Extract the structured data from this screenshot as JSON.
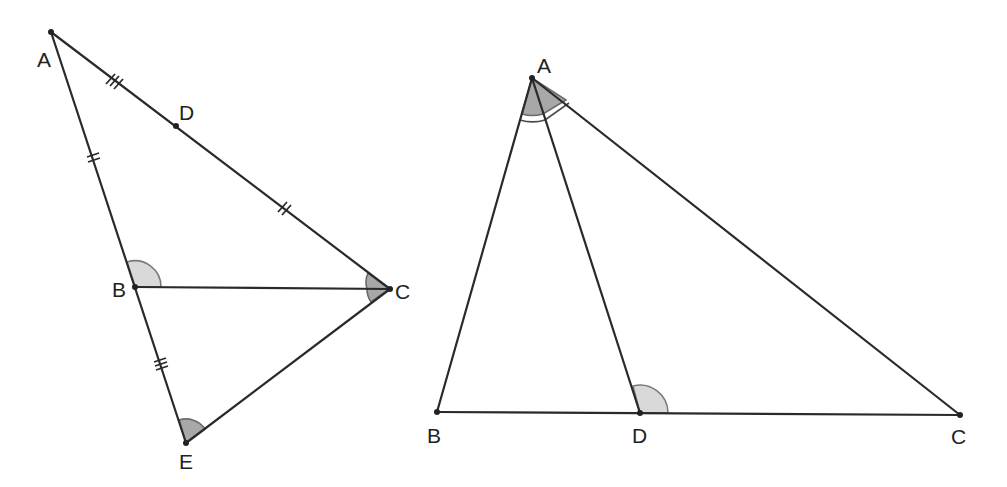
{
  "figures": [
    {
      "name": "left-figure",
      "points": {
        "A": {
          "label": "A",
          "x": 51,
          "y": 32
        },
        "D": {
          "label": "D",
          "x": 176,
          "y": 126
        },
        "B": {
          "label": "B",
          "x": 135,
          "y": 287
        },
        "C": {
          "label": "C",
          "x": 390,
          "y": 289
        },
        "E": {
          "label": "E",
          "x": 186,
          "y": 443
        }
      },
      "segments": [
        "AC",
        "AE",
        "BC",
        "CE"
      ],
      "equal_marks": [
        {
          "segment": "AD",
          "ticks": 3
        },
        {
          "segment": "AB",
          "ticks": 2
        },
        {
          "segment": "DC",
          "ticks": 2
        },
        {
          "segment": "BE",
          "ticks": 3
        }
      ],
      "angles": [
        {
          "vertex": "B",
          "between": [
            "A",
            "C"
          ],
          "shade": "light"
        },
        {
          "vertex": "C",
          "between": [
            "B",
            "E"
          ],
          "shade": "dark"
        },
        {
          "vertex": "E",
          "between": [
            "B",
            "C"
          ],
          "shade": "dark"
        }
      ]
    },
    {
      "name": "right-figure",
      "points": {
        "A": {
          "label": "A",
          "x": 532,
          "y": 78
        },
        "B": {
          "label": "B",
          "x": 437,
          "y": 412
        },
        "D": {
          "label": "D",
          "x": 640,
          "y": 413
        },
        "C": {
          "label": "C",
          "x": 960,
          "y": 415
        }
      },
      "segments": [
        "AB",
        "AC",
        "AD",
        "BC"
      ],
      "angles": [
        {
          "vertex": "A",
          "between": [
            "B",
            "D"
          ],
          "shade": "dark",
          "arcs": 2
        },
        {
          "vertex": "A",
          "between": [
            "D",
            "C"
          ],
          "shade": "dark",
          "arcs": 2
        },
        {
          "vertex": "D",
          "between": [
            "A",
            "C"
          ],
          "shade": "light"
        }
      ]
    }
  ],
  "colors": {
    "line": "#2a2a2a",
    "angle_light": "#d9d9d9",
    "angle_dark": "#a8a8a8"
  }
}
